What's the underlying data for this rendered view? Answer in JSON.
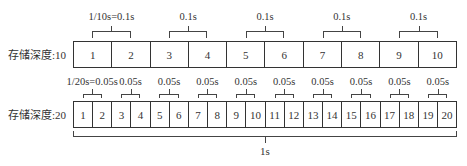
{
  "diagram": {
    "row1": {
      "label": "存储深度:10",
      "cells": [
        "1",
        "2",
        "3",
        "4",
        "5",
        "6",
        "7",
        "8",
        "9",
        "10"
      ],
      "groups": [
        "1/10s=0.1s",
        "0.1s",
        "0.1s",
        "0.1s",
        "0.1s"
      ]
    },
    "row2": {
      "label": "存储深度:20",
      "cells": [
        "1",
        "2",
        "3",
        "4",
        "5",
        "6",
        "7",
        "8",
        "9",
        "10",
        "11",
        "12",
        "13",
        "14",
        "15",
        "16",
        "17",
        "18",
        "19",
        "20"
      ],
      "groups": [
        "1/20s=0.05s",
        "0.05s",
        "0.05s",
        "0.05s",
        "0.05s",
        "0.05s",
        "0.05s",
        "0.05s",
        "0.05s",
        "0.05s"
      ]
    },
    "total_label": "1s",
    "colors": {
      "line": "#444444",
      "text": "#333333",
      "background": "#ffffff"
    }
  }
}
